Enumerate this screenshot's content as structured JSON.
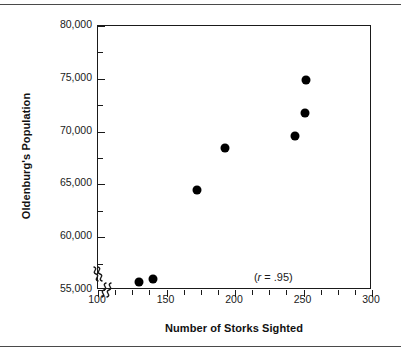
{
  "figure": {
    "background_color": "#ffffff",
    "frame_color": "#1a1a1a",
    "rule_color": "#4a4a4a",
    "point_color": "#000000"
  },
  "chart_data": {
    "type": "scatter",
    "title": "",
    "xlabel": "Number of Storks Sighted",
    "ylabel": "Oldenburg's Population",
    "xlim": [
      100,
      300
    ],
    "ylim": [
      55000,
      80000
    ],
    "xticks": [
      100,
      150,
      200,
      250,
      300
    ],
    "xtick_labels": [
      "100",
      "150",
      "200",
      "250",
      "300"
    ],
    "xminor_ticks": [
      112.5,
      125,
      137.5,
      162.5,
      175,
      187.5,
      212.5,
      225,
      237.5,
      262.5,
      275,
      287.5
    ],
    "yticks": [
      55000,
      60000,
      65000,
      70000,
      75000,
      80000
    ],
    "ytick_labels": [
      "55,000",
      "60,000",
      "65,000",
      "70,000",
      "75,000",
      "80,000"
    ],
    "yminor_ticks": [
      57500,
      62500,
      67500,
      72500,
      77500
    ],
    "grid": false,
    "legend": null,
    "axis_break_x": true,
    "axis_break_y": true,
    "annotations": [
      {
        "text_prefix": "(",
        "text_italic": "r",
        "text_suffix": " = .95)",
        "full_text": "(r = .95)",
        "x": 228,
        "y": 56000
      }
    ],
    "x": [
      130,
      140,
      172,
      193,
      244,
      251,
      252
    ],
    "y": [
      55800,
      56000,
      64500,
      68400,
      69600,
      71800,
      74900
    ],
    "points": [
      {
        "x": 130,
        "y": 55800
      },
      {
        "x": 140,
        "y": 56000
      },
      {
        "x": 172,
        "y": 64500
      },
      {
        "x": 193,
        "y": 68400
      },
      {
        "x": 244,
        "y": 69600
      },
      {
        "x": 251,
        "y": 71800
      },
      {
        "x": 252,
        "y": 74900
      }
    ],
    "correlation": ".95"
  }
}
